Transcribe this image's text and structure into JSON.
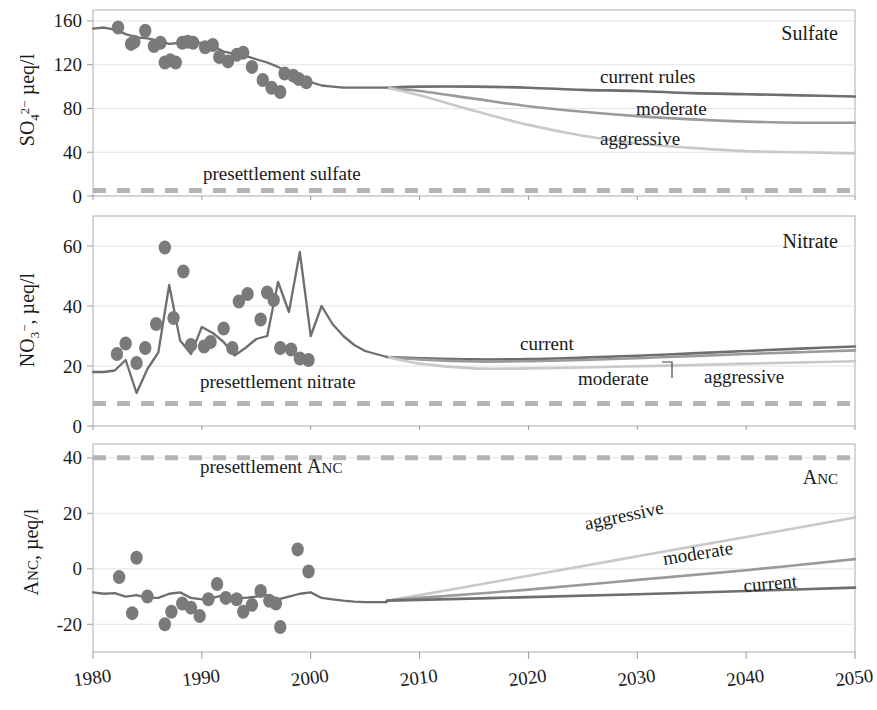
{
  "figure": {
    "xlabel": "",
    "x_ticks": [
      1980,
      1990,
      2000,
      2010,
      2020,
      2030,
      2040,
      2050
    ],
    "xlim": [
      1980,
      2050
    ],
    "colors": {
      "current": "#6e6e6e",
      "moderate": "#9a9a9a",
      "aggressive": "#c9c9c9",
      "observed_line": "#6e6e6e",
      "observed_points": "#7a7a7a",
      "presettlement": "#b5b5b5",
      "axis": "#9a9a9a",
      "grid": "#dddddd",
      "text": "#1a1a1a"
    }
  },
  "panels": [
    {
      "id": "sulfate",
      "title": "Sulfate",
      "ylabel_parts": {
        "base": "SO",
        "sub": "4",
        "sup": "2−",
        "unit": " µeq/l"
      },
      "ylabel_text": "SO42− µeq/l",
      "y_ticks": [
        0,
        40,
        80,
        120,
        160
      ],
      "ylim": [
        0,
        170
      ],
      "presettlement_label": "presettlement sulfate",
      "presettlement_value": 5,
      "scenario_labels": [
        "current rules",
        "moderate",
        "aggressive"
      ]
    },
    {
      "id": "nitrate",
      "title": "Nitrate",
      "ylabel_parts": {
        "base": "NO",
        "sub": "3",
        "sup": "−",
        "unit": ", µeq/l"
      },
      "ylabel_text": "NO3−, µeq/l",
      "y_ticks": [
        0,
        20,
        40,
        60
      ],
      "ylim": [
        0,
        70
      ],
      "presettlement_label": "presettlement nitrate",
      "presettlement_value": 7.5,
      "scenario_labels": [
        "current",
        "moderate",
        "aggressive"
      ]
    },
    {
      "id": "anc",
      "title": "Anc",
      "ylabel_parts": {
        "base": "Anc",
        "sub": "",
        "sup": "",
        "unit": ", µeq/l"
      },
      "ylabel_text": "Anc, µeq/l",
      "y_ticks": [
        -20,
        0,
        20,
        40
      ],
      "ylim": [
        -30,
        45
      ],
      "presettlement_label": "presettlement Anc",
      "presettlement_value": 40,
      "scenario_labels": [
        "aggressive",
        "moderate",
        "current"
      ]
    }
  ],
  "chart_data": {
    "type": "line",
    "title": "",
    "xlabel": "",
    "x": [
      1980,
      1990,
      2000,
      2010,
      2020,
      2030,
      2040,
      2050
    ],
    "xlim": [
      1980,
      2050
    ],
    "grid": true,
    "legend_position": "inline-curve-labels",
    "panels": [
      {
        "name": "Sulfate",
        "ylabel": "SO4 2- ueq/l",
        "ylim": [
          0,
          170
        ],
        "yticks": [
          0,
          40,
          80,
          120,
          160
        ],
        "observed_line": {
          "name": "observed/modeled historic",
          "x": [
            1980,
            1981,
            1982,
            1983,
            1984,
            1985,
            1986,
            1987,
            1988,
            1989,
            1990,
            1991,
            1992,
            1993,
            1994,
            1995,
            1996,
            1997,
            1998,
            1999,
            2000,
            2001,
            2002,
            2003,
            2004,
            2005,
            2006,
            2007
          ],
          "y": [
            153,
            154,
            152,
            148,
            145,
            144,
            142,
            139,
            140,
            140,
            140,
            137,
            132,
            130,
            128,
            125,
            122,
            118,
            112,
            108,
            104,
            101,
            100,
            99,
            99,
            99,
            99,
            99
          ]
        },
        "observed_points": {
          "name": "measurements",
          "x": [
            1982.3,
            1983.5,
            1983.8,
            1984.8,
            1985.6,
            1986.2,
            1986.6,
            1987.1,
            1987.6,
            1988.2,
            1988.7,
            1989.2,
            1990.3,
            1991.0,
            1991.6,
            1992.4,
            1993.2,
            1993.8,
            1994.6,
            1995.6,
            1996.4,
            1997.2,
            1997.6,
            1998.4,
            1998.9,
            1999.6
          ],
          "y": [
            154,
            139,
            141,
            151,
            137,
            140,
            122,
            124,
            122,
            140,
            141,
            140,
            136,
            138,
            127,
            123,
            129,
            131,
            118,
            106,
            99,
            95,
            112,
            110,
            107,
            104
          ]
        },
        "scenarios": [
          {
            "name": "current rules",
            "x": [
              2007,
              2010,
              2015,
              2020,
              2025,
              2030,
              2035,
              2040,
              2045,
              2050
            ],
            "y": [
              99,
              100,
              100,
              99,
              97,
              96,
              94,
              93,
              92,
              91
            ]
          },
          {
            "name": "moderate",
            "x": [
              2007,
              2010,
              2015,
              2020,
              2025,
              2030,
              2035,
              2040,
              2045,
              2050
            ],
            "y": [
              99,
              96,
              89,
              82,
              77,
              73,
              70,
              68,
              67,
              67
            ]
          },
          {
            "name": "aggressive",
            "x": [
              2007,
              2010,
              2015,
              2020,
              2025,
              2030,
              2035,
              2040,
              2045,
              2050
            ],
            "y": [
              99,
              92,
              78,
              65,
              55,
              48,
              44,
              41,
              40,
              39
            ]
          }
        ],
        "reference_line": {
          "name": "presettlement sulfate",
          "value": 5
        }
      },
      {
        "name": "Nitrate",
        "ylabel": "NO3- , ueq/l",
        "ylim": [
          0,
          70
        ],
        "yticks": [
          0,
          20,
          40,
          60
        ],
        "observed_line": {
          "name": "observed/modeled historic",
          "x": [
            1980,
            1981,
            1982,
            1983,
            1984,
            1985,
            1986,
            1987,
            1988,
            1989,
            1990,
            1991,
            1992,
            1993,
            1994,
            1995,
            1996,
            1997,
            1998,
            1999,
            2000,
            2001,
            2002,
            2003,
            2004,
            2005,
            2006,
            2007
          ],
          "y": [
            18,
            18,
            18.5,
            22,
            11,
            19,
            24.5,
            47,
            28.5,
            24,
            33,
            31,
            28,
            23.5,
            26,
            29,
            30,
            48,
            38,
            58,
            30,
            40,
            34,
            30,
            27,
            25,
            24,
            23
          ]
        },
        "observed_points": {
          "name": "measurements",
          "x": [
            1982.2,
            1983.0,
            1984.0,
            1984.8,
            1985.8,
            1986.6,
            1987.4,
            1988.3,
            1989.0,
            1990.2,
            1990.8,
            1992.0,
            1992.8,
            1993.4,
            1994.2,
            1995.4,
            1996.0,
            1996.6,
            1997.2,
            1998.2,
            1999.0,
            1999.8
          ],
          "y": [
            24,
            27.5,
            21,
            26,
            34,
            59.5,
            36,
            51.5,
            27,
            26.5,
            28,
            32.5,
            26,
            41.5,
            44,
            35.5,
            44.5,
            42,
            26,
            25.5,
            22.5,
            22
          ]
        },
        "scenarios": [
          {
            "name": "current",
            "x": [
              2007,
              2010,
              2015,
              2020,
              2025,
              2030,
              2035,
              2040,
              2045,
              2050
            ],
            "y": [
              23,
              22.6,
              22.2,
              22.3,
              22.8,
              23.4,
              24.2,
              25.0,
              25.8,
              26.5
            ]
          },
          {
            "name": "moderate",
            "x": [
              2007,
              2010,
              2015,
              2020,
              2025,
              2030,
              2035,
              2040,
              2045,
              2050
            ],
            "y": [
              23,
              22.2,
              21.5,
              21.6,
              22.0,
              22.6,
              23.3,
              24.0,
              24.6,
              25.2
            ]
          },
          {
            "name": "aggressive",
            "x": [
              2007,
              2010,
              2015,
              2020,
              2025,
              2030,
              2035,
              2040,
              2045,
              2050
            ],
            "y": [
              23,
              20.8,
              19.2,
              19.2,
              19.5,
              19.9,
              20.3,
              20.8,
              21.2,
              21.6
            ]
          }
        ],
        "reference_line": {
          "name": "presettlement nitrate",
          "value": 7.5
        }
      },
      {
        "name": "Anc",
        "ylabel": "Anc, ueq/l",
        "ylim": [
          -30,
          45
        ],
        "yticks": [
          -20,
          0,
          20,
          40
        ],
        "observed_line": {
          "name": "observed/modeled historic",
          "x": [
            1980,
            1981,
            1982,
            1983,
            1984,
            1985,
            1986,
            1987,
            1988,
            1989,
            1990,
            1991,
            1992,
            1993,
            1994,
            1995,
            1996,
            1997,
            1998,
            1999,
            2000,
            2001,
            2002,
            2003,
            2004,
            2005,
            2006,
            2007
          ],
          "y": [
            -8.5,
            -9,
            -8.8,
            -10,
            -9.5,
            -10.5,
            -10.5,
            -9,
            -8.5,
            -10.5,
            -11,
            -10.5,
            -9.5,
            -10.5,
            -10.5,
            -10,
            -9.5,
            -11,
            -10,
            -9,
            -8.5,
            -10.5,
            -11,
            -11.5,
            -11.8,
            -12,
            -12,
            -12
          ]
        },
        "observed_points": {
          "name": "measurements",
          "x": [
            1982.4,
            1983.6,
            1984.0,
            1985.0,
            1986.6,
            1987.2,
            1988.2,
            1989.0,
            1989.8,
            1990.6,
            1991.4,
            1992.2,
            1993.2,
            1993.8,
            1994.6,
            1995.4,
            1996.2,
            1996.8,
            1997.2,
            1998.8,
            1999.8
          ],
          "y": [
            -3,
            -16,
            4,
            -10,
            -20,
            -15.5,
            -12.5,
            -14,
            -17,
            -11,
            -5.5,
            -10.5,
            -11,
            -15.5,
            -13,
            -8,
            -11.5,
            -12.5,
            -21,
            7,
            -1
          ]
        },
        "scenarios": [
          {
            "name": "aggressive",
            "x": [
              2007,
              2010,
              2020,
              2030,
              2040,
              2050
            ],
            "y": [
              -11.5,
              -9.5,
              -2.5,
              4.5,
              11.5,
              18.5
            ]
          },
          {
            "name": "moderate",
            "x": [
              2007,
              2010,
              2020,
              2030,
              2040,
              2050
            ],
            "y": [
              -11.5,
              -10.5,
              -7.5,
              -4,
              -0.5,
              3.5
            ]
          },
          {
            "name": "current",
            "x": [
              2007,
              2010,
              2020,
              2030,
              2040,
              2050
            ],
            "y": [
              -11.5,
              -11.2,
              -10.2,
              -9.2,
              -8.0,
              -6.8
            ]
          }
        ],
        "reference_line": {
          "name": "presettlement Anc",
          "value": 40
        }
      }
    ]
  }
}
